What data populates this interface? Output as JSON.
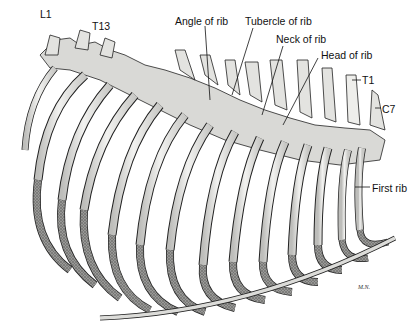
{
  "figure": {
    "labels": [
      {
        "id": "l1",
        "text": "L1",
        "x": 40,
        "y": 9
      },
      {
        "id": "t13",
        "text": "T13",
        "x": 92,
        "y": 21
      },
      {
        "id": "angle",
        "text": "Angle of rib",
        "x": 175,
        "y": 16
      },
      {
        "id": "tubercle",
        "text": "Tubercle of rib",
        "x": 245,
        "y": 16
      },
      {
        "id": "neck",
        "text": "Neck of rib",
        "x": 276,
        "y": 34
      },
      {
        "id": "head",
        "text": "Head of rib",
        "x": 321,
        "y": 50
      },
      {
        "id": "t1",
        "text": "T1",
        "x": 362,
        "y": 75
      },
      {
        "id": "c7",
        "text": "C7",
        "x": 382,
        "y": 104
      },
      {
        "id": "first_rib",
        "text": "First rib",
        "x": 372,
        "y": 183
      }
    ],
    "signature": "M.N.",
    "colors": {
      "bone": "#e9e9e6",
      "bone_shadow": "#8a8a88",
      "cartilage": "#7d7d7b",
      "outline": "#222222",
      "background": "#ffffff"
    }
  }
}
